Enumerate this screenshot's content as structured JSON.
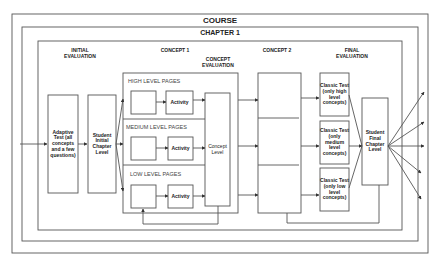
{
  "diagram": {
    "course_label": "COURSE",
    "chapter_label": "CHAPTER 1",
    "sections": {
      "initial_evaluation": "INITIAL EVALUATION",
      "concept1": "CONCEPT 1",
      "concept_evaluation": "CONCEPT EVALUATION",
      "concept2": "CONCEPT 2",
      "final_evaluation": "FINAL EVALUATION"
    },
    "nodes": {
      "adaptive_test": "Adaptive Test (all concepts and a few questions)",
      "student_initial": "Student Initial Chapter Level",
      "high_level_pages": "HIGH LEVEL PAGES",
      "medium_level_pages": "MEDIUM LEVEL PAGES",
      "low_level_pages": "LOW LEVEL PAGES",
      "activity_high": "Activity",
      "activity_medium": "Activity",
      "activity_low": "Activity",
      "concept_level": "Concept Level",
      "classic_test_high": "Classic Test (only high level concepts)",
      "classic_test_medium": "Classic Test (only medium level concepts)",
      "classic_test_low": "Classic Test (only low level concepts)",
      "student_final": "Student Final Chapter Level"
    },
    "colors": {
      "line": "#555555",
      "text": "#222222",
      "background": "#ffffff"
    }
  }
}
